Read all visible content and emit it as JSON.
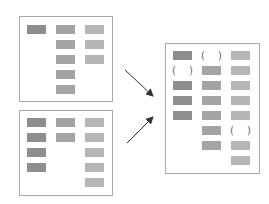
{
  "colors": {
    "border": "#a9a9a9",
    "dark": "#8e8e8e",
    "mid": "#a4a4a4",
    "light": "#b6b6b6",
    "arrow": "#333333"
  },
  "panels": [
    {
      "name": "source-panel-a",
      "rect": [
        19,
        16,
        94,
        86
      ],
      "blocks": [
        {
          "x": 27,
          "y": 25,
          "c": "dark"
        },
        {
          "x": 56,
          "y": 25,
          "c": "mid"
        },
        {
          "x": 56,
          "y": 40,
          "c": "mid"
        },
        {
          "x": 56,
          "y": 55,
          "c": "mid"
        },
        {
          "x": 56,
          "y": 70,
          "c": "mid"
        },
        {
          "x": 56,
          "y": 85,
          "c": "mid"
        },
        {
          "x": 85,
          "y": 25,
          "c": "light"
        },
        {
          "x": 85,
          "y": 40,
          "c": "light"
        },
        {
          "x": 85,
          "y": 55,
          "c": "light"
        }
      ],
      "gaps": []
    },
    {
      "name": "source-panel-b",
      "rect": [
        19,
        110,
        94,
        86
      ],
      "blocks": [
        {
          "x": 27,
          "y": 118,
          "c": "dark"
        },
        {
          "x": 27,
          "y": 133,
          "c": "dark"
        },
        {
          "x": 27,
          "y": 148,
          "c": "dark"
        },
        {
          "x": 27,
          "y": 163,
          "c": "dark"
        },
        {
          "x": 56,
          "y": 118,
          "c": "mid"
        },
        {
          "x": 56,
          "y": 133,
          "c": "mid"
        },
        {
          "x": 85,
          "y": 118,
          "c": "light"
        },
        {
          "x": 85,
          "y": 133,
          "c": "light"
        },
        {
          "x": 85,
          "y": 148,
          "c": "light"
        },
        {
          "x": 85,
          "y": 163,
          "c": "light"
        },
        {
          "x": 85,
          "y": 178,
          "c": "light"
        }
      ],
      "gaps": []
    },
    {
      "name": "merged-panel",
      "rect": [
        165,
        43,
        95,
        131
      ],
      "blocks": [
        {
          "x": 173,
          "y": 51,
          "c": "dark"
        },
        {
          "x": 173,
          "y": 81,
          "c": "dark"
        },
        {
          "x": 173,
          "y": 96,
          "c": "dark"
        },
        {
          "x": 173,
          "y": 111,
          "c": "dark"
        },
        {
          "x": 202,
          "y": 66,
          "c": "mid"
        },
        {
          "x": 202,
          "y": 81,
          "c": "mid"
        },
        {
          "x": 202,
          "y": 96,
          "c": "mid"
        },
        {
          "x": 202,
          "y": 111,
          "c": "mid"
        },
        {
          "x": 202,
          "y": 126,
          "c": "mid"
        },
        {
          "x": 202,
          "y": 141,
          "c": "mid"
        },
        {
          "x": 231,
          "y": 51,
          "c": "light"
        },
        {
          "x": 231,
          "y": 66,
          "c": "light"
        },
        {
          "x": 231,
          "y": 81,
          "c": "light"
        },
        {
          "x": 231,
          "y": 96,
          "c": "light"
        },
        {
          "x": 231,
          "y": 111,
          "c": "light"
        },
        {
          "x": 231,
          "y": 141,
          "c": "light"
        },
        {
          "x": 231,
          "y": 156,
          "c": "light"
        }
      ],
      "gaps": [
        {
          "x": 201,
          "y": 50
        },
        {
          "x": 172,
          "y": 65
        },
        {
          "x": 230,
          "y": 125
        }
      ]
    }
  ],
  "gap_glyphs": {
    "open": "(",
    "close": ")"
  },
  "arrows": [
    {
      "name": "arrow-from-a",
      "from": [
        125,
        70
      ],
      "to": [
        153,
        96
      ]
    },
    {
      "name": "arrow-from-b",
      "from": [
        127,
        143
      ],
      "to": [
        153,
        117
      ]
    }
  ]
}
